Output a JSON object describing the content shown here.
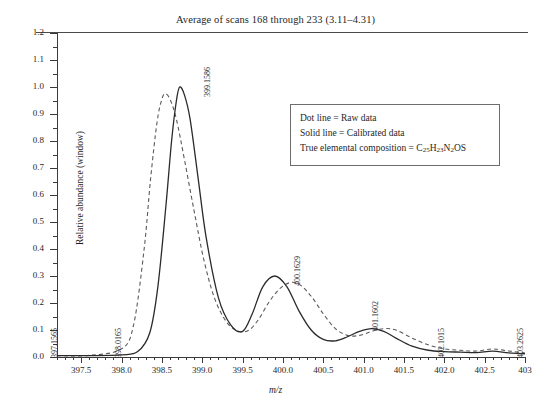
{
  "title": "Average of scans 168 through 233 (3.11–4.31)",
  "axes": {
    "ylabel": "Relative abundance (window)",
    "xlabel": "m/z",
    "yticks": [
      "0.0",
      "0.1",
      "0.2",
      "0.3",
      "0.4",
      "0.5",
      "0.6",
      "0.7",
      "0.8",
      "0.9",
      "1.0",
      "1.1",
      "1.2"
    ],
    "xticks": [
      "397.5",
      "398.0",
      "398.5",
      "399.0",
      "399.5",
      "400.0",
      "400.5",
      "401.0",
      "401.5",
      "402.0",
      "402.5",
      "403.0",
      "403"
    ],
    "ylim": [
      0.0,
      1.2
    ],
    "xlim": [
      397.2,
      403.0
    ]
  },
  "legend": {
    "line1": "Dot line = Raw data",
    "line2": "Solid line = Calibrated data",
    "line3_prefix": "True elemental composition = C",
    "sub1": "25",
    "mid1": "H",
    "sub2": "23",
    "mid2": "N",
    "sub3": "2",
    "tail": "OS"
  },
  "annotations": [
    {
      "label": "397.1565"
    },
    {
      "label": "398.0165"
    },
    {
      "label": "399.1586"
    },
    {
      "label": "400.1629"
    },
    {
      "label": "401.1602"
    },
    {
      "label": "402.1015"
    },
    {
      "label": "403.2625"
    }
  ],
  "colors": {
    "solid": "#2b2b2b",
    "dashed": "#5a5a5a",
    "axis": "#3a3a3a"
  },
  "chart_data": {
    "type": "line",
    "title": "Average of scans 168 through 233 (3.11–4.31)",
    "xlabel": "m/z",
    "ylabel": "Relative abundance (window)",
    "xlim": [
      397.2,
      403.0
    ],
    "ylim": [
      0.0,
      1.2
    ],
    "grid": false,
    "legend_position": "inside-upper-right",
    "series": [
      {
        "name": "Calibrated data",
        "style": "solid",
        "peaks": [
          {
            "mz": 399.1586,
            "relative_abundance": 1.0
          },
          {
            "mz": 400.1629,
            "relative_abundance": 0.3
          },
          {
            "mz": 401.1602,
            "relative_abundance": 0.105
          },
          {
            "mz": 402.1015,
            "relative_abundance": 0.02
          },
          {
            "mz": 403.2625,
            "relative_abundance": 0.012
          }
        ],
        "x": [
          397.2,
          397.6,
          398.0,
          398.2,
          398.35,
          398.45,
          398.55,
          398.62,
          398.68,
          398.72,
          398.78,
          398.85,
          398.95,
          399.05,
          399.2,
          399.35,
          399.5,
          399.62,
          399.75,
          399.9,
          400.05,
          400.2,
          400.35,
          400.5,
          400.65,
          400.8,
          400.95,
          401.1,
          401.25,
          401.4,
          401.6,
          401.8,
          402.0,
          402.2,
          402.4,
          402.6,
          402.8,
          403.0
        ],
        "y": [
          0.005,
          0.005,
          0.008,
          0.02,
          0.09,
          0.26,
          0.56,
          0.8,
          0.95,
          1.0,
          0.97,
          0.88,
          0.66,
          0.44,
          0.22,
          0.12,
          0.095,
          0.16,
          0.26,
          0.3,
          0.26,
          0.17,
          0.1,
          0.065,
          0.06,
          0.075,
          0.095,
          0.105,
          0.095,
          0.07,
          0.04,
          0.025,
          0.02,
          0.018,
          0.016,
          0.022,
          0.015,
          0.012
        ]
      },
      {
        "name": "Raw data",
        "style": "dashed",
        "x": [
          397.2,
          397.6,
          398.0,
          398.15,
          398.28,
          398.36,
          398.44,
          398.5,
          398.54,
          398.6,
          398.68,
          398.78,
          398.9,
          399.02,
          399.15,
          399.3,
          399.45,
          399.58,
          399.7,
          399.82,
          399.95,
          400.08,
          400.2,
          400.35,
          400.5,
          400.65,
          400.8,
          400.95,
          401.1,
          401.25,
          401.4,
          401.6,
          401.8,
          402.0,
          402.2,
          402.4,
          402.6,
          402.8,
          403.0
        ],
        "y": [
          0.005,
          0.006,
          0.03,
          0.12,
          0.4,
          0.66,
          0.87,
          0.955,
          0.975,
          0.955,
          0.88,
          0.73,
          0.54,
          0.36,
          0.22,
          0.13,
          0.095,
          0.1,
          0.14,
          0.2,
          0.25,
          0.275,
          0.27,
          0.225,
          0.16,
          0.105,
          0.08,
          0.08,
          0.095,
          0.105,
          0.1,
          0.07,
          0.045,
          0.03,
          0.025,
          0.022,
          0.03,
          0.022,
          0.015
        ]
      }
    ]
  }
}
